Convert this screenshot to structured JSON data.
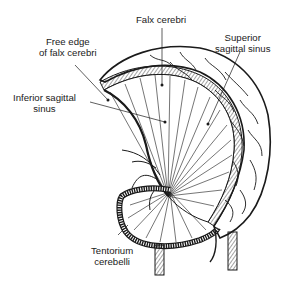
{
  "diagram": {
    "type": "anatomical-illustration",
    "labels": [
      {
        "id": "falx",
        "text": "Falx cerebri"
      },
      {
        "id": "free_edge_1",
        "text": "Free edge"
      },
      {
        "id": "free_edge_2",
        "text": "of falx cerebri"
      },
      {
        "id": "superior_1",
        "text": "Superior"
      },
      {
        "id": "superior_2",
        "text": "sagittal sinus"
      },
      {
        "id": "inferior_1",
        "text": "Inferior sagittal"
      },
      {
        "id": "inferior_2",
        "text": "sinus"
      },
      {
        "id": "tentorium_1",
        "text": "Tentorium"
      },
      {
        "id": "tentorium_2",
        "text": "cerebelli"
      }
    ],
    "colors": {
      "ink": "#1a1a1a",
      "background": "#ffffff"
    }
  }
}
